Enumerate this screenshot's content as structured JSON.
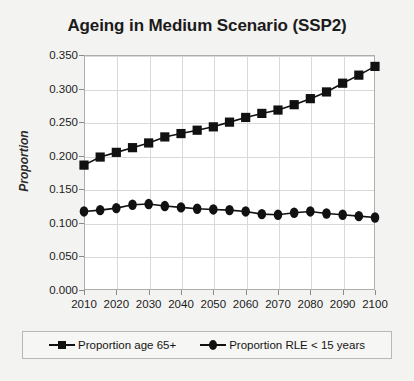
{
  "chart_data": {
    "type": "line",
    "title": "Ageing in Medium Scenario (SSP2)",
    "xlabel": "",
    "ylabel": "Proportion",
    "xlim": [
      2010,
      2100
    ],
    "ylim": [
      0.0,
      0.35
    ],
    "grid": true,
    "legend_position": "bottom",
    "x": [
      2010,
      2015,
      2020,
      2025,
      2030,
      2035,
      2040,
      2045,
      2050,
      2055,
      2060,
      2065,
      2070,
      2075,
      2080,
      2085,
      2090,
      2095,
      2100
    ],
    "xticks": [
      "2010",
      "2020",
      "2030",
      "2040",
      "2050",
      "2060",
      "2070",
      "2080",
      "2090",
      "2100"
    ],
    "yticks": [
      "0.000",
      "0.050",
      "0.100",
      "0.150",
      "0.200",
      "0.250",
      "0.300",
      "0.350"
    ],
    "series": [
      {
        "name": "Proportion age 65+",
        "marker": "square",
        "color": "#111111",
        "values": [
          0.186,
          0.198,
          0.205,
          0.212,
          0.219,
          0.228,
          0.233,
          0.238,
          0.243,
          0.25,
          0.257,
          0.263,
          0.268,
          0.276,
          0.285,
          0.295,
          0.308,
          0.32,
          0.333
        ]
      },
      {
        "name": "Proportion RLE < 15 years",
        "marker": "circle",
        "color": "#111111",
        "values": [
          0.117,
          0.119,
          0.122,
          0.127,
          0.128,
          0.125,
          0.123,
          0.121,
          0.12,
          0.119,
          0.117,
          0.113,
          0.112,
          0.115,
          0.117,
          0.114,
          0.112,
          0.11,
          0.108
        ]
      }
    ]
  },
  "legend": {
    "entries": [
      {
        "label": "Proportion age 65+",
        "marker": "square"
      },
      {
        "label": "Proportion RLE < 15 years",
        "marker": "circle"
      }
    ]
  }
}
